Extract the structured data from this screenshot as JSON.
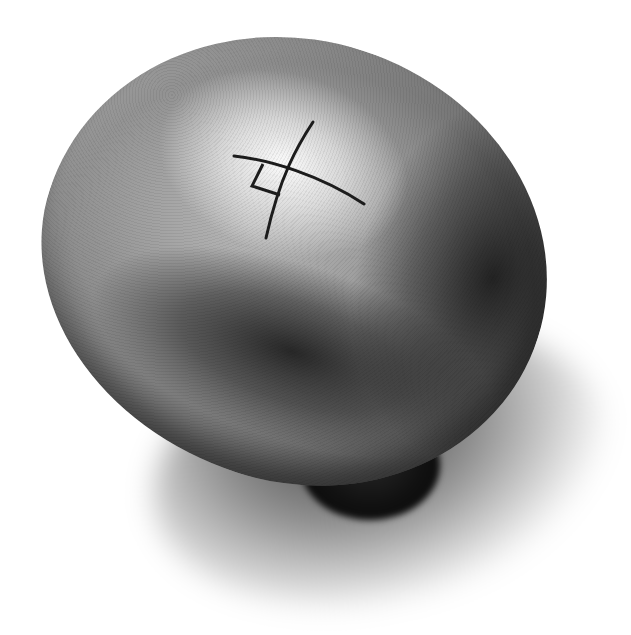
{
  "image": {
    "subject": "metallic egg-shaped knob with engraved right-angle symbol",
    "colors": {
      "background": "#ffffff",
      "highlight": "#f2f2f2",
      "midtone": "#8e8e8e",
      "shadow": "#111111",
      "symbol_stroke": "#1c1c1c"
    },
    "symbol": {
      "name": "perpendicular-cross-with-square",
      "stroke_width": 3
    }
  }
}
